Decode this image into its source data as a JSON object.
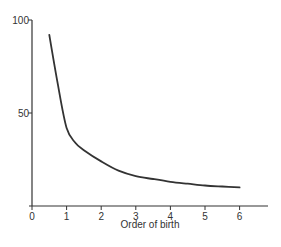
{
  "chart_data": {
    "type": "line",
    "title": "",
    "xlabel": "Order of birth",
    "ylabel": "",
    "xlim": [
      0,
      6.8
    ],
    "ylim": [
      0,
      100
    ],
    "x_ticks": [
      "0",
      "1",
      "2",
      "3",
      "4",
      "5",
      "6"
    ],
    "y_ticks": [
      "50",
      "100"
    ],
    "grid": false,
    "legend": null,
    "series": [
      {
        "name": "curve",
        "color": "#333333",
        "x": [
          0.5,
          0.75,
          1.0,
          1.25,
          1.5,
          2.0,
          2.5,
          3.0,
          3.5,
          4.0,
          4.5,
          5.0,
          5.5,
          6.0
        ],
        "values": [
          92,
          65,
          42,
          34,
          30,
          24,
          19,
          16,
          14.5,
          13,
          12,
          11,
          10.5,
          10
        ]
      }
    ]
  }
}
